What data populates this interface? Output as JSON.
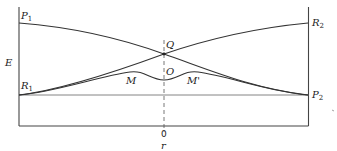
{
  "diagram": {
    "type": "potential-energy-curve-crossing",
    "axes": {
      "y_label": "E",
      "x_label": "r",
      "x_tick": "0"
    },
    "points": {
      "P1": {
        "letter": "P",
        "sub": "1"
      },
      "R1": {
        "letter": "R",
        "sub": "1"
      },
      "R2": {
        "letter": "R",
        "sub": "2"
      },
      "P2": {
        "letter": "P",
        "sub": "2"
      },
      "Q": {
        "letter": "Q"
      },
      "O": {
        "letter": "O"
      },
      "M": {
        "letter": "M"
      },
      "Mprime": {
        "letter": "M'"
      }
    },
    "colors": {
      "line": "#333333",
      "background": "#ffffff"
    }
  }
}
